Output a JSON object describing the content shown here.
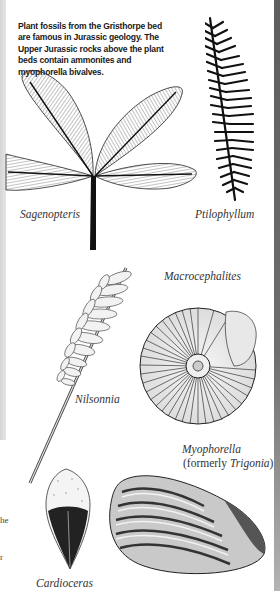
{
  "intro_text": "Plant fossils from the Gristhorpe bed are famous in Jurassic geology. The Upper Jurassic rocks above the plant beds contain ammonites and myophorella bivalves.",
  "captions": {
    "sagenopteris": "Sagenopteris",
    "ptilophyllum": "Ptilophyllum",
    "macrocephalites": "Macrocephalites",
    "nilsonnia": "Nilsonnia",
    "myophorella": "Myophorella",
    "formerly_prefix": "(formerly ",
    "trigonia": "Trigonia",
    "formerly_suffix": ")",
    "cardioceras": "Cardioceras"
  },
  "cut_off_fragments": [
    "he",
    "r"
  ],
  "colors": {
    "ink": "#1a1a1a",
    "left_strip": "#dcdcdc",
    "right_border": "#666666"
  }
}
